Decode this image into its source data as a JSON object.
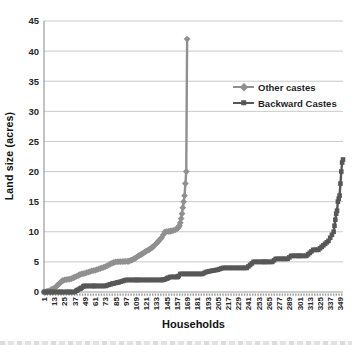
{
  "chart_data": {
    "type": "line",
    "title": "",
    "xlabel": "Households",
    "ylabel": "Land size (acres)",
    "xlim": [
      1,
      352
    ],
    "ylim": [
      0,
      45
    ],
    "grid": true,
    "legend_position": "upper-right-inside",
    "y_ticks": [
      45,
      40,
      35,
      30,
      25,
      20,
      15,
      10,
      5,
      0
    ],
    "x_ticks": [
      1,
      13,
      25,
      37,
      49,
      61,
      73,
      85,
      97,
      109,
      121,
      133,
      145,
      157,
      169,
      181,
      193,
      205,
      217,
      229,
      241,
      253,
      265,
      277,
      289,
      301,
      313,
      325,
      337,
      349
    ],
    "series": [
      {
        "name": "Other castes",
        "marker": "diamond",
        "color": "#909090",
        "points": [
          [
            1,
            0
          ],
          [
            4,
            0.05
          ],
          [
            7,
            0.2
          ],
          [
            10,
            0.4
          ],
          [
            13,
            0.6
          ],
          [
            16,
            1
          ],
          [
            19,
            1.4
          ],
          [
            22,
            1.8
          ],
          [
            25,
            2
          ],
          [
            29,
            2.1
          ],
          [
            33,
            2.2
          ],
          [
            36,
            2.4
          ],
          [
            39,
            2.6
          ],
          [
            42,
            2.8
          ],
          [
            45,
            3
          ],
          [
            49,
            3.1
          ],
          [
            53,
            3.3
          ],
          [
            57,
            3.5
          ],
          [
            61,
            3.6
          ],
          [
            65,
            3.8
          ],
          [
            69,
            4
          ],
          [
            73,
            4.2
          ],
          [
            77,
            4.5
          ],
          [
            81,
            4.8
          ],
          [
            85,
            5
          ],
          [
            100,
            5.1
          ],
          [
            104,
            5.3
          ],
          [
            108,
            5.6
          ],
          [
            112,
            6
          ],
          [
            116,
            6.3
          ],
          [
            120,
            6.7
          ],
          [
            124,
            7
          ],
          [
            128,
            7.4
          ],
          [
            131,
            7.8
          ],
          [
            134,
            8.2
          ],
          [
            137,
            8.7
          ],
          [
            139,
            9
          ],
          [
            141,
            9.5
          ],
          [
            143,
            10
          ],
          [
            150,
            10.1
          ],
          [
            155,
            10.3
          ],
          [
            158,
            10.6
          ],
          [
            160,
            11
          ],
          [
            161,
            11.5
          ],
          [
            162,
            12.2
          ],
          [
            163,
            13
          ],
          [
            164,
            14
          ],
          [
            165,
            15
          ],
          [
            166,
            16
          ],
          [
            167,
            18
          ],
          [
            168,
            20
          ],
          [
            169,
            42
          ]
        ]
      },
      {
        "name": "Backward Castes",
        "marker": "square",
        "color": "#575757",
        "points": [
          [
            1,
            0
          ],
          [
            10,
            0
          ],
          [
            20,
            0
          ],
          [
            30,
            0
          ],
          [
            37,
            0
          ],
          [
            40,
            0.3
          ],
          [
            44,
            0.6
          ],
          [
            48,
            1
          ],
          [
            60,
            1
          ],
          [
            73,
            1
          ],
          [
            77,
            1.2
          ],
          [
            82,
            1.4
          ],
          [
            88,
            1.6
          ],
          [
            93,
            1.8
          ],
          [
            97,
            2
          ],
          [
            110,
            2
          ],
          [
            125,
            2
          ],
          [
            140,
            2
          ],
          [
            143,
            2.1
          ],
          [
            146,
            2.3
          ],
          [
            149,
            2.5
          ],
          [
            158,
            2.5
          ],
          [
            161,
            3
          ],
          [
            175,
            3
          ],
          [
            187,
            3
          ],
          [
            191,
            3.3
          ],
          [
            197,
            3.5
          ],
          [
            205,
            3.7
          ],
          [
            211,
            4
          ],
          [
            225,
            4
          ],
          [
            239,
            4
          ],
          [
            243,
            4.5
          ],
          [
            247,
            5
          ],
          [
            260,
            5
          ],
          [
            269,
            5
          ],
          [
            273,
            5.5
          ],
          [
            287,
            5.5
          ],
          [
            291,
            6
          ],
          [
            300,
            6
          ],
          [
            309,
            6
          ],
          [
            313,
            6.5
          ],
          [
            317,
            7
          ],
          [
            323,
            7
          ],
          [
            327,
            7.5
          ],
          [
            331,
            8
          ],
          [
            335,
            8.5
          ],
          [
            337,
            9
          ],
          [
            339,
            9.5
          ],
          [
            341,
            10
          ],
          [
            342,
            11
          ],
          [
            343,
            12
          ],
          [
            344,
            13
          ],
          [
            345,
            13.5
          ],
          [
            346,
            15
          ],
          [
            347,
            15.5
          ],
          [
            348,
            16
          ],
          [
            349,
            18
          ],
          [
            350,
            20
          ],
          [
            351,
            21.5
          ],
          [
            352,
            22
          ]
        ]
      }
    ]
  },
  "colors": {
    "gridline": "#c9c9c9",
    "axis": "#9b9b9b",
    "tick_dashes": "#a0a0a0",
    "tick_label": "#262626",
    "axis_title": "#111111"
  }
}
